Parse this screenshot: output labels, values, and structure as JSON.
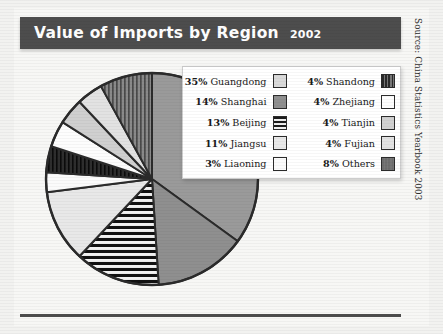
{
  "header": {
    "title": "Value of Imports by Region",
    "year": "2002",
    "bar_color": "#4d4d4d",
    "text_color": "#ffffff"
  },
  "source": {
    "label": "Source: China Statistics Yearbook 2003"
  },
  "chart_data": {
    "type": "pie",
    "title": "Value of Imports by Region",
    "subtitle": "2002",
    "unit": "percent",
    "start_angle_deg": 0,
    "direction": "clockwise",
    "categories": [
      "Guangdong",
      "Shanghai",
      "Beijing",
      "Jiangsu",
      "Liaoning",
      "Shandong",
      "Zhejiang",
      "Tianjin",
      "Fujian",
      "Others"
    ],
    "values": [
      35,
      14,
      13,
      11,
      3,
      4,
      4,
      4,
      4,
      8
    ],
    "labels": [
      "35% Guangdong",
      "14% Shanghai",
      "13% Beijing",
      "11% Jiangsu",
      "3% Liaoning",
      "4% Shandong",
      "4% Zhejiang",
      "4% Tianjin",
      "4% Fujian",
      "8% Others"
    ],
    "slice_fills": [
      "#9a9a9a",
      "#8f8f8f",
      "#1c1c1c",
      "#e8e8e8",
      "#fbfbfb",
      "#2a2a2a",
      "#fdfdfd",
      "#d0d0d0",
      "#e2e2e2",
      "#6e6e6e"
    ],
    "slice_patterns": [
      "solid",
      "solid",
      "horizontal-stripes",
      "solid",
      "solid",
      "vertical-stripes",
      "solid",
      "solid",
      "solid",
      "vertical-stripes"
    ],
    "outline_color": "#2b2b2b",
    "legend_position": "inside-top-right",
    "grid": false
  },
  "legend": {
    "rows": [
      {
        "left": {
          "pct": "35%",
          "name": "Guangdong",
          "swatch": "#d9d9d9",
          "pattern": "solid"
        },
        "right": {
          "pct": "4%",
          "name": "Shandong",
          "swatch": "#2a2a2a",
          "pattern": "vertical-stripes"
        }
      },
      {
        "left": {
          "pct": "14%",
          "name": "Shanghai",
          "swatch": "#8f8f8f",
          "pattern": "solid"
        },
        "right": {
          "pct": "4%",
          "name": "Zhejiang",
          "swatch": "#fdfdfd",
          "pattern": "solid"
        }
      },
      {
        "left": {
          "pct": "13%",
          "name": "Beijing",
          "swatch": "#1c1c1c",
          "pattern": "horizontal-stripes"
        },
        "right": {
          "pct": "4%",
          "name": "Tianjin",
          "swatch": "#d0d0d0",
          "pattern": "solid"
        }
      },
      {
        "left": {
          "pct": "11%",
          "name": "Jiangsu",
          "swatch": "#e8e8e8",
          "pattern": "solid"
        },
        "right": {
          "pct": "4%",
          "name": "Fujian",
          "swatch": "#e2e2e2",
          "pattern": "solid"
        }
      },
      {
        "left": {
          "pct": "3%",
          "name": "Liaoning",
          "swatch": "#fbfbfb",
          "pattern": "solid"
        },
        "right": {
          "pct": "8%",
          "name": "Others",
          "swatch": "#6e6e6e",
          "pattern": "vertical-stripes"
        }
      }
    ]
  }
}
